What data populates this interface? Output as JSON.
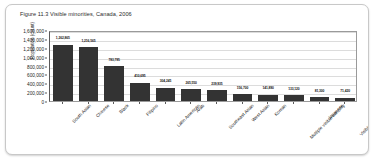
{
  "card": {
    "name": "figure-card"
  },
  "chart_data": {
    "type": "bar",
    "title": "Figure 11.3 Visible minorities, Canada, 2006",
    "xlabel": "",
    "ylabel": "Population (count)",
    "ylim": [
      0,
      1600000
    ],
    "grid": true,
    "legend": "none",
    "ytick_labels": [
      "1,600,000",
      "1,400,000",
      "1,200,000",
      "1,000,000",
      "800,000",
      "600,000",
      "400,000",
      "200,000",
      "0"
    ],
    "ytick_values": [
      1600000,
      1400000,
      1200000,
      1000000,
      800000,
      600000,
      400000,
      200000,
      0
    ],
    "categories": [
      "South Asian",
      "Chinese",
      "Black",
      "Filipino",
      "Latin American",
      "Arab",
      "Southeast Asian",
      "West Asian",
      "Korean",
      "Multiple visible minority",
      "Japanese",
      "Visible minority, n.i.e."
    ],
    "values": [
      1262865,
      1216565,
      783795,
      410695,
      304245,
      265550,
      239935,
      156700,
      141890,
      133120,
      81300,
      71420
    ],
    "value_labels": [
      "1,262,865",
      "1,216,565",
      "783,795",
      "410,695",
      "304,245",
      "265,550",
      "239,935",
      "156,700",
      "141,890",
      "133,120",
      "81,300",
      "71,420"
    ],
    "bar_color": "#333333",
    "grid_color": "#dcdcdc",
    "axis_color": "#5a5a5a",
    "plot_background": "#ffffff"
  }
}
